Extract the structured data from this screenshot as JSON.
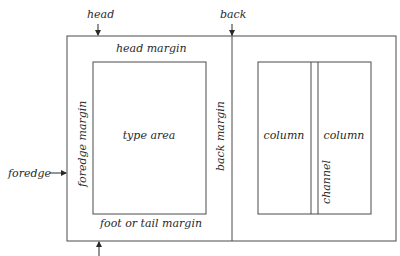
{
  "diagram": {
    "type": "page-layout",
    "labels": {
      "head": "head",
      "back": "back",
      "foredge": "foredge",
      "head_margin": "head margin",
      "foredge_margin": "foredge margin",
      "type_area": "type area",
      "back_margin": "back margin",
      "foot_margin": "foot or tail margin",
      "column_left": "column",
      "column_right": "column",
      "channel": "channel"
    },
    "colors": {
      "line": "#4a4a4a",
      "text": "#2a2a2a",
      "background": "#ffffff"
    }
  }
}
